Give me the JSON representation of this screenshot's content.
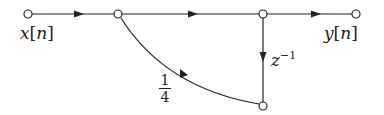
{
  "diagram": {
    "type": "signal-flow-graph",
    "nodes": [
      {
        "id": "input",
        "x": 28,
        "y": 14
      },
      {
        "id": "n1",
        "x": 118,
        "y": 14
      },
      {
        "id": "n2",
        "x": 263,
        "y": 14
      },
      {
        "id": "output",
        "x": 356,
        "y": 14
      },
      {
        "id": "n3",
        "x": 263,
        "y": 106
      }
    ],
    "edges": [
      {
        "from": "input",
        "to": "n1",
        "gain": ""
      },
      {
        "from": "n1",
        "to": "n2",
        "gain": ""
      },
      {
        "from": "n2",
        "to": "output",
        "gain": ""
      },
      {
        "from": "n2",
        "to": "n3",
        "gain": "z^-1"
      },
      {
        "from": "n3",
        "to": "n1",
        "gain": "1/4"
      }
    ],
    "labels": {
      "input_var": "x",
      "input_idx": "n",
      "output_var": "y",
      "output_idx": "n",
      "delay_base": "z",
      "delay_exp": "−1",
      "feedback_num": "1",
      "feedback_den": "4"
    },
    "colors": {
      "line": "#222222",
      "node_fill": "#ffffff"
    }
  }
}
